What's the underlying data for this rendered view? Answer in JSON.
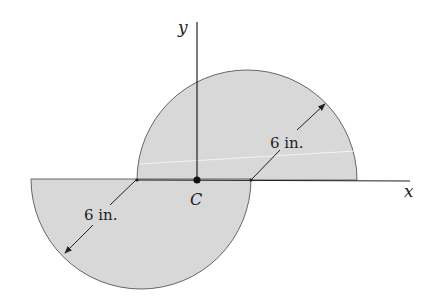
{
  "figure": {
    "type": "composite area diagram",
    "fill_color": "#d8d8d8",
    "stroke_color": "#555555",
    "axes": {
      "x_label": "x",
      "y_label": "y"
    },
    "centroid_label": "C",
    "upper_semicircle": {
      "radius_label": "6 in."
    },
    "lower_semicircle": {
      "radius_label": "6 in."
    }
  }
}
